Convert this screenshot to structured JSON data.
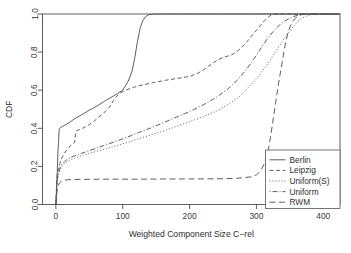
{
  "chart_data": {
    "type": "line",
    "title": "",
    "xlabel": "Weighted Component Size C−rel",
    "ylabel": "CDF",
    "xlim": [
      -20,
      425
    ],
    "ylim": [
      0.0,
      1.0
    ],
    "grid": false,
    "legend_position": "bottom-right",
    "xticks": [
      0,
      100,
      200,
      300,
      400
    ],
    "xticklabels": [
      "0",
      "100",
      "200",
      "300",
      "400"
    ],
    "yticks": [
      0.0,
      0.2,
      0.4,
      0.6,
      0.8,
      1.0
    ],
    "yticklabels": [
      "0.0",
      "0.2",
      "0.4",
      "0.6",
      "0.8",
      "1.0"
    ],
    "series": [
      {
        "name": "Berlin",
        "linestyle": "solid",
        "dash": "none",
        "x": [
          0,
          1,
          2,
          3,
          4,
          5,
          7,
          10,
          14,
          20,
          28,
          38,
          50,
          62,
          74,
          84,
          92,
          100,
          108,
          114,
          118,
          122,
          126,
          130,
          134,
          138,
          144,
          152,
          165,
          185,
          210,
          245,
          290,
          340,
          380,
          425
        ],
        "y": [
          0.0,
          0.06,
          0.16,
          0.27,
          0.33,
          0.395,
          0.405,
          0.41,
          0.418,
          0.43,
          0.45,
          0.47,
          0.495,
          0.518,
          0.545,
          0.565,
          0.582,
          0.6,
          0.645,
          0.7,
          0.77,
          0.855,
          0.925,
          0.965,
          0.985,
          0.995,
          0.999,
          1.0,
          1.0,
          1.0,
          1.0,
          1.0,
          1.0,
          1.0,
          1.0,
          1.0
        ]
      },
      {
        "name": "Leipzig",
        "linestyle": "dashed",
        "dash": "4,2.6",
        "x": [
          0,
          1,
          2,
          4,
          6,
          9,
          13,
          18,
          24,
          28,
          29,
          30,
          34,
          40,
          48,
          58,
          70,
          80,
          86,
          90,
          96,
          104,
          116,
          130,
          146,
          164,
          182,
          200,
          212,
          220,
          228,
          236,
          244,
          250,
          256,
          262,
          270,
          278,
          286,
          294,
          300,
          306,
          312,
          316,
          320,
          325,
          340,
          370,
          400,
          425
        ],
        "y": [
          0.0,
          0.1,
          0.155,
          0.19,
          0.215,
          0.245,
          0.27,
          0.295,
          0.315,
          0.325,
          0.36,
          0.385,
          0.392,
          0.4,
          0.415,
          0.44,
          0.475,
          0.51,
          0.545,
          0.565,
          0.585,
          0.6,
          0.615,
          0.628,
          0.64,
          0.652,
          0.662,
          0.672,
          0.688,
          0.705,
          0.725,
          0.745,
          0.762,
          0.772,
          0.778,
          0.784,
          0.8,
          0.825,
          0.855,
          0.89,
          0.915,
          0.94,
          0.965,
          0.978,
          0.99,
          0.998,
          1.0,
          1.0,
          1.0,
          1.0
        ]
      },
      {
        "name": "Uniform(S)",
        "linestyle": "dotted",
        "dash": "1,2",
        "x": [
          0,
          1,
          2,
          4,
          6,
          9,
          13,
          18,
          24,
          30,
          38,
          48,
          60,
          74,
          90,
          106,
          124,
          142,
          160,
          180,
          200,
          220,
          240,
          258,
          274,
          288,
          300,
          312,
          322,
          330,
          338,
          344,
          350,
          356,
          362,
          368,
          374,
          382,
          400,
          425
        ],
        "y": [
          0.0,
          0.085,
          0.125,
          0.16,
          0.182,
          0.2,
          0.215,
          0.228,
          0.238,
          0.246,
          0.256,
          0.266,
          0.278,
          0.292,
          0.308,
          0.325,
          0.345,
          0.365,
          0.385,
          0.41,
          0.435,
          0.46,
          0.49,
          0.525,
          0.565,
          0.615,
          0.66,
          0.715,
          0.765,
          0.808,
          0.852,
          0.882,
          0.912,
          0.938,
          0.96,
          0.977,
          0.988,
          0.997,
          1.0,
          1.0
        ]
      },
      {
        "name": "Uniform",
        "linestyle": "dashdot",
        "dash": "1,2,5,2",
        "x": [
          0,
          1,
          2,
          4,
          6,
          9,
          13,
          18,
          24,
          30,
          38,
          48,
          60,
          74,
          90,
          106,
          124,
          142,
          160,
          180,
          200,
          220,
          240,
          258,
          272,
          284,
          294,
          302,
          310,
          318,
          326,
          334,
          342,
          352,
          362,
          372,
          385,
          400,
          425
        ],
        "y": [
          0.0,
          0.085,
          0.13,
          0.165,
          0.19,
          0.21,
          0.225,
          0.24,
          0.25,
          0.258,
          0.268,
          0.28,
          0.295,
          0.312,
          0.332,
          0.352,
          0.378,
          0.402,
          0.428,
          0.458,
          0.488,
          0.522,
          0.562,
          0.608,
          0.655,
          0.705,
          0.752,
          0.795,
          0.838,
          0.878,
          0.912,
          0.94,
          0.962,
          0.982,
          0.994,
          0.999,
          1.0,
          1.0,
          1.0
        ]
      },
      {
        "name": "RWM",
        "linestyle": "longdash",
        "dash": "6,3.5",
        "x": [
          0,
          1,
          2,
          3,
          5,
          8,
          12,
          18,
          26,
          36,
          50,
          70,
          95,
          125,
          160,
          200,
          240,
          270,
          292,
          300,
          306,
          312,
          318,
          322,
          326,
          330,
          334,
          338,
          341,
          344,
          347,
          350,
          354,
          358,
          362,
          368,
          375,
          385,
          400,
          425
        ],
        "y": [
          0.0,
          0.045,
          0.075,
          0.095,
          0.112,
          0.122,
          0.127,
          0.13,
          0.131,
          0.132,
          0.132,
          0.133,
          0.133,
          0.133,
          0.134,
          0.134,
          0.135,
          0.137,
          0.145,
          0.155,
          0.175,
          0.215,
          0.29,
          0.375,
          0.47,
          0.565,
          0.655,
          0.735,
          0.8,
          0.855,
          0.9,
          0.932,
          0.96,
          0.978,
          0.99,
          0.997,
          1.0,
          1.0,
          1.0,
          1.0
        ]
      }
    ]
  },
  "legend": {
    "entries": [
      {
        "label": "Berlin"
      },
      {
        "label": "Leipzig"
      },
      {
        "label": "Uniform(S)"
      },
      {
        "label": "Uniform"
      },
      {
        "label": "RWM"
      }
    ]
  }
}
